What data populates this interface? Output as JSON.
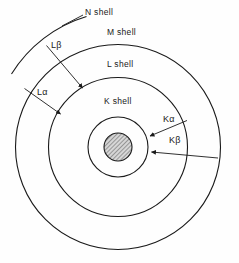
{
  "figure": {
    "background_color": "#fefefe",
    "line_color": "#1a1a1a",
    "nucleus_fill": "#b8b8b8"
  },
  "shells": [
    {
      "id": "n-shell",
      "label": "N shell",
      "label_x": 85,
      "label_y": 11,
      "type": "arc",
      "radius": 133
    },
    {
      "id": "m-shell",
      "label": "M shell",
      "label_x": 107,
      "label_y": 31,
      "type": "circle",
      "radius": 103
    },
    {
      "id": "l-shell",
      "label": "L shell",
      "label_x": 107,
      "label_y": 63,
      "type": "circle",
      "radius": 70
    },
    {
      "id": "k-shell",
      "label": "K shell",
      "label_x": 104,
      "label_y": 100,
      "type": "circle",
      "radius": 30
    }
  ],
  "nucleus": {
    "id": "nucleus",
    "center_x": 118,
    "center_y": 147,
    "radius": 14,
    "hatch": "diagonal"
  },
  "transitions": [
    {
      "id": "l-beta",
      "label": "Lβ",
      "label_x": 51,
      "label_y": 43,
      "from_shell": "N shell",
      "to_shell": "L shell"
    },
    {
      "id": "l-alpha",
      "label": "Lα",
      "label_x": 37,
      "label_y": 89,
      "from_shell": "N shell",
      "to_shell": "L shell"
    },
    {
      "id": "k-alpha",
      "label": "Kα",
      "label_x": 163,
      "label_y": 117,
      "from_shell": "L shell",
      "to_shell": "K shell"
    },
    {
      "id": "k-beta",
      "label": "Kβ",
      "label_x": 169,
      "label_y": 138,
      "from_shell": "M shell",
      "to_shell": "K shell"
    }
  ],
  "geometry": {
    "center_x": 118,
    "center_y": 147
  }
}
